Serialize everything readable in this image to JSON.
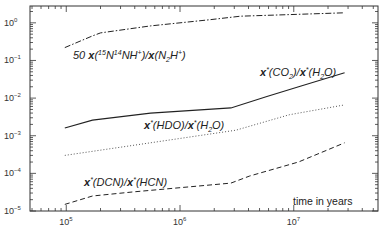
{
  "chart_data": {
    "type": "line",
    "title": "",
    "xlabel": "time in years",
    "ylabel": "",
    "xscale": "log",
    "yscale": "log",
    "xlim": [
      48000,
      55000000
    ],
    "ylim": [
      1e-05,
      2.8
    ],
    "grid": false,
    "legend": "none (inline annotations)",
    "x_ticks": [
      {
        "value": 100000,
        "label_base": "10",
        "label_exp": "5"
      },
      {
        "value": 1000000,
        "label_base": "10",
        "label_exp": "6"
      },
      {
        "value": 10000000,
        "label_base": "10",
        "label_exp": "7"
      }
    ],
    "y_ticks": [
      {
        "value": 1,
        "label_base": "10",
        "label_exp": "0"
      },
      {
        "value": 0.1,
        "label_base": "10",
        "label_exp": "-1"
      },
      {
        "value": 0.01,
        "label_base": "10",
        "label_exp": "-2"
      },
      {
        "value": 0.001,
        "label_base": "10",
        "label_exp": "-3"
      },
      {
        "value": 0.0001,
        "label_base": "10",
        "label_exp": "-4"
      },
      {
        "value": 1e-05,
        "label_base": "10",
        "label_exp": "-5"
      }
    ],
    "series": [
      {
        "name": "50 x(15N14NH+)/x(N2H+)",
        "style": "dash-dot",
        "x": [
          97000,
          170000,
          200000,
          550000,
          1800000,
          3400000,
          28000000
        ],
        "y": [
          0.22,
          0.45,
          0.54,
          0.83,
          1.2,
          1.5,
          1.85
        ]
      },
      {
        "name": "x*(CO2)/x*(H2O)",
        "style": "solid",
        "x": [
          97000,
          170000,
          550000,
          2800000,
          5800000,
          11600000,
          28000000
        ],
        "y": [
          0.0016,
          0.0026,
          0.004,
          0.0055,
          0.011,
          0.021,
          0.047
        ]
      },
      {
        "name": "x*(HDO)/x*(H2O)",
        "style": "dotted",
        "x": [
          97000,
          550000,
          3100000,
          9100000,
          28000000
        ],
        "y": [
          0.0003,
          0.00065,
          0.0014,
          0.0036,
          0.0066
        ]
      },
      {
        "name": "x*(DCN)/x*(HCN)",
        "style": "dashed",
        "x": [
          97000,
          170000,
          380000,
          2800000,
          4100000,
          11000000,
          28000000
        ],
        "y": [
          1.5e-05,
          2.5e-05,
          3.2e-05,
          5.5e-05,
          8.5e-05,
          0.0002,
          0.00065
        ]
      }
    ],
    "annotations": [
      {
        "text": "50 x(15N14NH+)/x(N2H+)",
        "near_series": 0
      },
      {
        "text": "x*(CO2)/x*(H2O)",
        "near_series": 1
      },
      {
        "text": "x*(HDO)/x*(H2O)",
        "near_series": 2
      },
      {
        "text": "x*(DCN)/x*(HCN)",
        "near_series": 3
      }
    ]
  },
  "labels": {
    "xlabel": "time in years",
    "n15": {
      "coef": "50 ",
      "x1": "x",
      "iso1": "15",
      "n1": "N",
      "iso2": "14",
      "rest1": "NH",
      "plus1": "+",
      "mid": ")/",
      "x2": "x",
      "n2": "(N",
      "sub2": "2",
      "h2": "H",
      "plus2": "+",
      "close": ")"
    },
    "co2": {
      "x1": "x",
      "star1": "*",
      "a": "(CO",
      "sub1": "2",
      "b": ")/",
      "x2": "x",
      "star2": "*",
      "c": "(H",
      "sub2": "2",
      "d": "O)"
    },
    "hdo": {
      "x1": "x",
      "star1": "*",
      "a": "(HDO)/",
      "x2": "x",
      "star2": "*",
      "c": "(H",
      "sub2": "2",
      "d": "O)"
    },
    "dcn": {
      "x1": "x",
      "star1": "*",
      "a": "(DCN)/",
      "x2": "x",
      "star2": "*",
      "c": "(HCN)"
    }
  },
  "colors": {
    "axis": "#333333",
    "line": "#222222",
    "dotted": "#555555"
  }
}
